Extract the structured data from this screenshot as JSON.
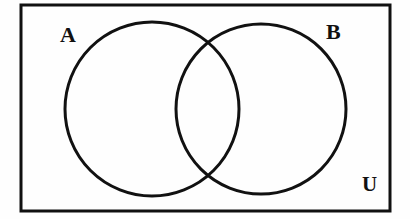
{
  "figure": {
    "type": "venn-diagram",
    "title": "",
    "background_color": "#fefefe",
    "stroke_color": "#111111",
    "fill_color": "none"
  },
  "universe": {
    "label": "U",
    "shape": "rectangle",
    "x": 21,
    "y": 5,
    "width": 369,
    "height": 206,
    "stroke_width": 3,
    "label_x": 371,
    "label_y": 185
  },
  "sets": [
    {
      "label": "A",
      "shape": "circle",
      "cx": 152,
      "cy": 109,
      "r": 87,
      "stroke_width": 3,
      "label_x": 70,
      "label_y": 35
    },
    {
      "label": "B",
      "shape": "circle",
      "cx": 261,
      "cy": 109,
      "r": 85,
      "stroke_width": 3,
      "label_x": 335,
      "label_y": 32
    }
  ],
  "intersection": {
    "top_point": [
      207,
      48
    ],
    "bottom_point": [
      207,
      172
    ],
    "shaded": false
  }
}
